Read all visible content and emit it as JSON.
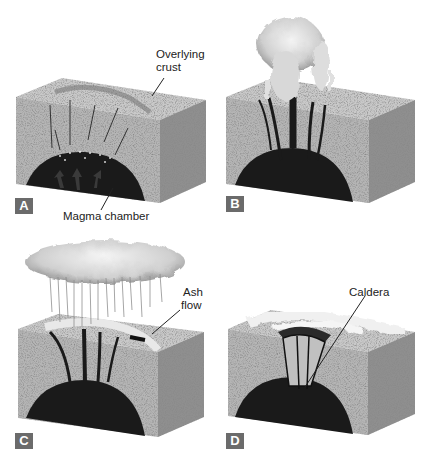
{
  "figure": {
    "panels": [
      {
        "letter": "A",
        "labels": {
          "crust_line1": "Overlying",
          "crust_line2": "crust",
          "chamber": "Magma chamber"
        }
      },
      {
        "letter": "B",
        "labels": {}
      },
      {
        "letter": "C",
        "labels": {
          "ash_line1": "Ash",
          "ash_line2": "flow"
        }
      },
      {
        "letter": "D",
        "labels": {
          "caldera": "Caldera"
        }
      }
    ]
  },
  "colors": {
    "front_face": "#b5b5b5",
    "side_face": "#8f8f8f",
    "top_face": "#c9c9c9",
    "magma": "#1a1a1a",
    "badge": "#6b6b6b",
    "cloud": "#e6e6e6"
  }
}
